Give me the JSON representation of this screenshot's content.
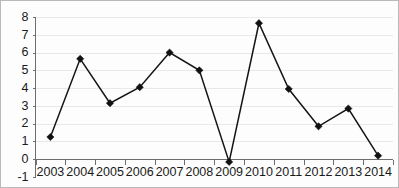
{
  "chart_data": {
    "type": "line",
    "title": "",
    "subtitle": "",
    "xlabel": "",
    "ylabel": "",
    "categories": [
      "2003",
      "2004",
      "2005",
      "2006",
      "2007",
      "2008",
      "2009",
      "2010",
      "2011",
      "2012",
      "2013",
      "2014"
    ],
    "values": [
      1.25,
      5.65,
      3.15,
      4.05,
      6.0,
      5.0,
      -0.15,
      7.65,
      3.95,
      1.85,
      2.85,
      0.2
    ],
    "ylim": [
      -1,
      8
    ],
    "yticks": [
      "8",
      "7",
      "6",
      "5",
      "4",
      "3",
      "2",
      "1",
      "0",
      "-1"
    ],
    "ytick_values": [
      8,
      7,
      6,
      5,
      4,
      3,
      2,
      1,
      0,
      -1
    ],
    "xtick_labels": [
      "2003",
      "2004",
      "2005",
      "2006",
      "2007",
      "2008",
      "2009",
      "2010",
      "2011",
      "2012",
      "2013",
      "2014"
    ],
    "grid": true,
    "grid_axis": "y",
    "legend": false,
    "legend_position": "none",
    "marker": "diamond",
    "annotations": []
  },
  "style": {
    "line_color": "#151515",
    "marker_color": "#111111",
    "grid_color": "#e9e9e9",
    "axis_color": "#6e6e6e",
    "text_color": "#1a1a1a",
    "background": "#fdfdfd",
    "border_color": "#b9b9b9"
  }
}
